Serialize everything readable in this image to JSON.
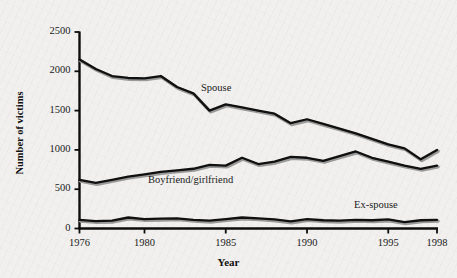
{
  "chart_data": {
    "type": "line",
    "title": "",
    "xlabel": "Year",
    "ylabel": "Number of victims",
    "xlim": [
      1976,
      1998
    ],
    "ylim": [
      0,
      2500
    ],
    "xticks": [
      1976,
      1980,
      1985,
      1990,
      1995,
      1998
    ],
    "xtick_labels": [
      "1976",
      "1980",
      "1985",
      "1990",
      "1995",
      "1998"
    ],
    "yticks": [
      0,
      500,
      1000,
      1500,
      2000,
      2500
    ],
    "ytick_labels": [
      "0",
      "500",
      "1000",
      "1500",
      "2000",
      "2500"
    ],
    "grid": false,
    "legend_position": "inline-annotations",
    "x": [
      1976,
      1977,
      1978,
      1979,
      1980,
      1981,
      1982,
      1983,
      1984,
      1985,
      1986,
      1987,
      1988,
      1989,
      1990,
      1991,
      1992,
      1993,
      1994,
      1995,
      1996,
      1997,
      1998
    ],
    "series": [
      {
        "name": "Spouse",
        "label": "Spouse",
        "color": "#101010",
        "values": [
          2150,
          2030,
          1940,
          1915,
          1910,
          1940,
          1800,
          1720,
          1500,
          1580,
          1540,
          1500,
          1460,
          1340,
          1390,
          1330,
          1270,
          1210,
          1140,
          1070,
          1020,
          880,
          1000
        ]
      },
      {
        "name": "Boyfriend/girlfriend",
        "label": "Boyfriend/girlfriend",
        "color": "#101010",
        "values": [
          620,
          580,
          620,
          660,
          690,
          720,
          740,
          760,
          810,
          800,
          900,
          820,
          850,
          910,
          900,
          860,
          920,
          980,
          900,
          850,
          800,
          760,
          800
        ]
      },
      {
        "name": "Ex-spouse",
        "label": "Ex-spouse",
        "color": "#101010",
        "values": [
          110,
          95,
          100,
          140,
          120,
          125,
          130,
          110,
          100,
          120,
          140,
          130,
          115,
          90,
          120,
          105,
          100,
          110,
          105,
          115,
          80,
          105,
          110
        ]
      }
    ]
  }
}
